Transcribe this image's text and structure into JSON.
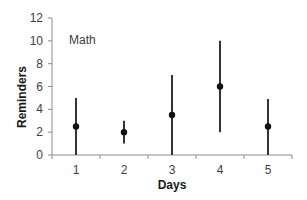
{
  "chart_data": {
    "type": "scatter",
    "subtype": "error-bar",
    "title": "",
    "annotation": "Math",
    "xlabel": "Days",
    "ylabel": "Reminders",
    "categories": [
      "1",
      "2",
      "3",
      "4",
      "5"
    ],
    "series": [
      {
        "name": "Math",
        "values": [
          2.5,
          2,
          3.5,
          6,
          2.5
        ],
        "upper": [
          5,
          3,
          7,
          10,
          4.9
        ],
        "lower": [
          0,
          1,
          0,
          2,
          0
        ]
      }
    ],
    "ylim": [
      0,
      12
    ],
    "yticks": [
      0,
      2,
      4,
      6,
      8,
      10,
      12
    ],
    "grid": false,
    "legend": "none",
    "colors": {
      "marker": "#111111",
      "errorbar": "#333333",
      "axis": "#8c8c8c"
    }
  }
}
